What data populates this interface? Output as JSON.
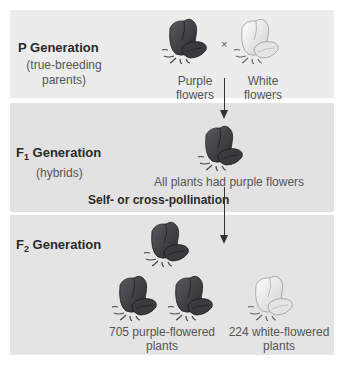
{
  "p_generation": {
    "title": "P Generation",
    "subtitle_line1": "(true-breeding",
    "subtitle_line2": "parents)",
    "cross_symbol": "×",
    "purple": {
      "label_line1": "Purple",
      "label_line2": "flowers",
      "icon": "purple-flower-icon"
    },
    "white": {
      "label_line1": "White",
      "label_line2": "flowers",
      "icon": "white-flower-icon"
    }
  },
  "f1_generation": {
    "title_prefix": "F",
    "title_sub": "1",
    "title_suffix": " Generation",
    "subtitle": "(hybrids)",
    "caption": "All plants had purple flowers"
  },
  "pollination_label": "Self- or cross-pollination",
  "f2_generation": {
    "title_prefix": "F",
    "title_sub": "2",
    "title_suffix": " Generation",
    "purple_caption_line1": "705 purple-flowered",
    "purple_caption_line2": "plants",
    "white_caption_line1": "224 white-flowered",
    "white_caption_line2": "plants",
    "purple_count": 705,
    "white_count": 224
  },
  "colors": {
    "purple_flower": "#3f3f44",
    "white_flower": "#efefef",
    "panel_p": "#ececec",
    "panel_f1": "#e2e2e2",
    "panel_f2": "#e4e4e4"
  }
}
